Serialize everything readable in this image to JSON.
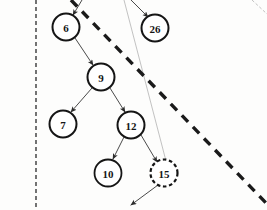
{
  "figure": {
    "kind": "binary-search-tree-fragment",
    "background_color": "#fdfdfc",
    "ink_color": "#151515",
    "edge_color": "#3a3a3a",
    "faint_color": "#9a9a9a"
  },
  "nodes": [
    {
      "id": "n6",
      "label": "6",
      "cx": 66,
      "cy": 27,
      "r": 13.5,
      "border": "solid",
      "stroke_width": 2.0
    },
    {
      "id": "n26",
      "label": "26",
      "cx": 155,
      "cy": 28,
      "r": 13.5,
      "border": "solid",
      "stroke_width": 2.0
    },
    {
      "id": "n9",
      "label": "9",
      "cx": 101,
      "cy": 77,
      "r": 13.5,
      "border": "solid",
      "stroke_width": 2.0
    },
    {
      "id": "n7",
      "label": "7",
      "cx": 63,
      "cy": 124,
      "r": 13.5,
      "border": "solid",
      "stroke_width": 2.0
    },
    {
      "id": "n12",
      "label": "12",
      "cx": 131,
      "cy": 125,
      "r": 13.5,
      "border": "solid",
      "stroke_width": 2.0
    },
    {
      "id": "n10",
      "label": "10",
      "cx": 108,
      "cy": 173,
      "r": 13.5,
      "border": "solid",
      "stroke_width": 1.8
    },
    {
      "id": "n15",
      "label": "15",
      "cx": 164,
      "cy": 173,
      "r": 13.5,
      "border": "dashed",
      "stroke_width": 2.2
    }
  ],
  "edges": [
    {
      "id": "e-in6",
      "from": "offscreen-top-left",
      "to": "n6",
      "x1": 82,
      "y1": 0,
      "x2": 73,
      "y2": 15,
      "arrow": true,
      "style": "solid",
      "weight": "thin"
    },
    {
      "id": "e-in26",
      "from": "offscreen-top-mid",
      "to": "n26",
      "x1": 131,
      "y1": 0,
      "x2": 148,
      "y2": 17,
      "arrow": true,
      "style": "solid",
      "weight": "thin"
    },
    {
      "id": "e-6-9",
      "from": "n6",
      "to": "n9",
      "x1": 75,
      "y1": 38,
      "x2": 93,
      "y2": 65,
      "arrow": true,
      "style": "solid",
      "weight": "thin"
    },
    {
      "id": "e-9-7",
      "from": "n9",
      "to": "n7",
      "x1": 92,
      "y1": 88,
      "x2": 71,
      "y2": 112,
      "arrow": true,
      "style": "solid",
      "weight": "thin"
    },
    {
      "id": "e-9-12",
      "from": "n9",
      "to": "n12",
      "x1": 110,
      "y1": 88,
      "x2": 125,
      "y2": 112,
      "arrow": true,
      "style": "solid",
      "weight": "thin"
    },
    {
      "id": "e-12-10",
      "from": "n12",
      "to": "n10",
      "x1": 124,
      "y1": 137,
      "x2": 113,
      "y2": 159,
      "arrow": true,
      "style": "solid",
      "weight": "thin"
    },
    {
      "id": "e-12-15",
      "from": "n12",
      "to": "n15",
      "x1": 141,
      "y1": 135,
      "x2": 157,
      "y2": 162,
      "arrow": true,
      "style": "solid",
      "weight": "thin"
    },
    {
      "id": "e-15-out",
      "from": "n15",
      "to": "offscreen-bottom",
      "x1": 158,
      "y1": 185,
      "x2": 131,
      "y2": 205,
      "arrow": true,
      "style": "solid",
      "weight": "thin"
    }
  ],
  "guide_lines": [
    {
      "id": "g-vertical-left",
      "name": "left-boundary-dashed-line",
      "x1": 36,
      "y1": 0,
      "x2": 36,
      "y2": 210,
      "style": "dashed",
      "weight": "thin",
      "dash": "4,3"
    },
    {
      "id": "g-faint-diagonal",
      "name": "faint-pointer-line-to-15",
      "x1": 124,
      "y1": 0,
      "x2": 166,
      "y2": 161,
      "style": "solid",
      "weight": "hair",
      "dash": ""
    },
    {
      "id": "g-thick-diagonal",
      "name": "thick-dashed-partition",
      "x1": 71,
      "y1": 0,
      "x2": 267,
      "y2": 204,
      "style": "dashed",
      "weight": "thick",
      "dash": "9,7"
    },
    {
      "id": "g-corner-diagonal",
      "name": "top-right-corner-line",
      "x1": 252,
      "y1": 0,
      "x2": 267,
      "y2": 14,
      "style": "dashed",
      "weight": "hair",
      "dash": "3,2"
    }
  ],
  "colors": {
    "node_stroke": "#151515",
    "node_fill": "#ffffff",
    "edge": "#4a4a4a",
    "guide_thick": "#1a1a1a",
    "guide_thin": "#2a2a2a",
    "guide_faint": "#a8a8a8"
  }
}
